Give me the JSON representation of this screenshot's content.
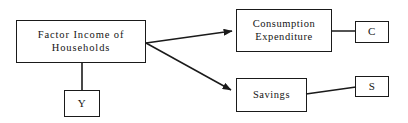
{
  "diagram": {
    "background_color": "#ffffff",
    "line_color": "#1a1a1a",
    "text_color": "#141414",
    "nodes": [
      {
        "id": "factor-income",
        "label": "Factor Income of\nHouseholds",
        "x": 16,
        "y": 20,
        "width": 130,
        "height": 43
      },
      {
        "id": "y",
        "label": "Y",
        "x": 64,
        "y": 90,
        "width": 36,
        "height": 27
      },
      {
        "id": "consumption",
        "label": "Consumption\nExpenditure",
        "x": 236,
        "y": 9,
        "width": 96,
        "height": 43
      },
      {
        "id": "c",
        "label": "C",
        "x": 355,
        "y": 21,
        "width": 34,
        "height": 22
      },
      {
        "id": "savings",
        "label": "Savings",
        "x": 236,
        "y": 78,
        "width": 71,
        "height": 34
      },
      {
        "id": "s",
        "label": "S",
        "x": 355,
        "y": 76,
        "width": 34,
        "height": 21
      }
    ],
    "edges": [
      {
        "id": "factor-income-to-consumption",
        "from": "factor-income",
        "to": "consumption",
        "arrowhead": true,
        "x1": 146,
        "y1": 43,
        "x2": 234,
        "y2": 31
      },
      {
        "id": "factor-income-to-savings",
        "from": "factor-income",
        "to": "savings",
        "arrowhead": true,
        "x1": 146,
        "y1": 43,
        "x2": 234,
        "y2": 92
      },
      {
        "id": "factor-income-to-y",
        "from": "factor-income",
        "to": "y",
        "arrowhead": false,
        "x1": 82,
        "y1": 63,
        "x2": 82,
        "y2": 90
      },
      {
        "id": "consumption-to-c",
        "from": "consumption",
        "to": "c",
        "arrowhead": false,
        "x1": 332,
        "y1": 31,
        "x2": 355,
        "y2": 31
      },
      {
        "id": "savings-to-s",
        "from": "savings",
        "to": "s",
        "arrowhead": false,
        "x1": 307,
        "y1": 94,
        "x2": 355,
        "y2": 87
      }
    ]
  }
}
